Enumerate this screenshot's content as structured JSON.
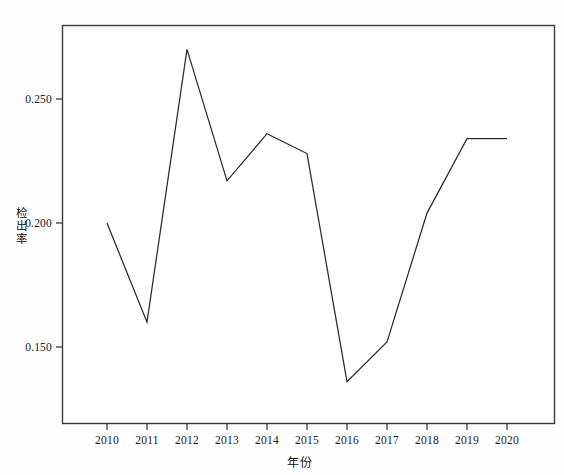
{
  "chart_data": {
    "type": "line",
    "title": "",
    "xlabel": "年份",
    "ylabel": "检出率",
    "categories": [
      "2010",
      "2011",
      "2012",
      "2013",
      "2014",
      "2015",
      "2016",
      "2017",
      "2018",
      "2019",
      "2020"
    ],
    "x": [
      2010,
      2011,
      2012,
      2013,
      2014,
      2015,
      2016,
      2017,
      2018,
      2019,
      2020
    ],
    "values": [
      0.2,
      0.16,
      0.27,
      0.217,
      0.236,
      0.228,
      0.136,
      0.152,
      0.204,
      0.234,
      0.234
    ],
    "series": [
      {
        "name": "检出率",
        "values": [
          0.2,
          0.16,
          0.27,
          0.217,
          0.236,
          0.228,
          0.136,
          0.152,
          0.204,
          0.234,
          0.234
        ]
      }
    ],
    "ytick_labels": [
      "0.250",
      "0.200",
      "0.150"
    ],
    "ytick_values": [
      0.25,
      0.2,
      0.15
    ],
    "ylim": [
      0.1265,
      0.2785
    ],
    "xlim": [
      2010,
      2020
    ],
    "grid": false,
    "legend": "none",
    "line_color": "#2b2b2b",
    "frame_color": "#3a3a3a",
    "background": "#ffffff"
  },
  "axes": {
    "x_title": "年份",
    "y_title_chars": [
      "检",
      "出",
      "率"
    ],
    "x_tick_labels": [
      "2010",
      "2011",
      "2012",
      "2013",
      "2014",
      "2015",
      "2016",
      "2017",
      "2018",
      "2019",
      "2020"
    ],
    "y_tick_labels": [
      "0.250",
      "0.200",
      "0.150"
    ]
  }
}
